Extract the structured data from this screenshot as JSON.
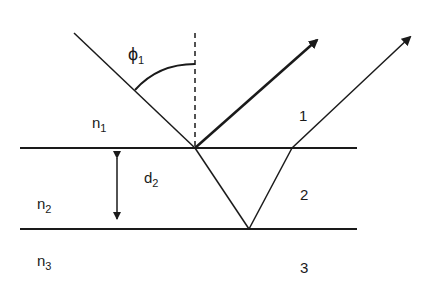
{
  "diagram": {
    "labels": {
      "phi": "ϕ",
      "phi_sub": "1",
      "n1": "n",
      "n1_sub": "1",
      "n2": "n",
      "n2_sub": "2",
      "n3": "n",
      "n3_sub": "3",
      "d": "d",
      "d_sub": "2",
      "ray1": "1",
      "region2": "2",
      "region3": "3"
    },
    "geometry": {
      "top_interface_y": 148,
      "bottom_interface_y": 229,
      "interface_x_start": 20,
      "interface_x_end": 357,
      "incidence_point": [
        195,
        148
      ],
      "incident_ray_start": [
        74,
        33
      ],
      "normal_top_y": 33,
      "reflected_ray_end": [
        317,
        40
      ],
      "refracted_bottom_point": [
        249,
        229
      ],
      "exit_point": [
        292,
        148
      ],
      "transmitted_ray_end": [
        410,
        37
      ],
      "thickness_arrow_x": 117
    },
    "colors": {
      "ink": "#1a1a1a",
      "background": "#ffffff"
    }
  }
}
